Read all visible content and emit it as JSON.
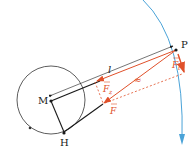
{
  "diagram": {
    "points": {
      "P": {
        "label": "P",
        "x": 176,
        "y": 50
      },
      "M": {
        "label": "M",
        "x": 51,
        "y": 100
      },
      "H": {
        "label": "H",
        "x": 64,
        "y": 133
      }
    },
    "labels": {
      "length": "l",
      "force_z": "F",
      "force_z_sub": "z",
      "force": "F",
      "force_t": "F",
      "force_t_sub": "t",
      "approx": "≈"
    },
    "colors": {
      "line": "#1a1a1a",
      "force": "#e0502a",
      "orbit": "#4aa3d8",
      "circle": "#333333"
    },
    "circle": {
      "cx": 51,
      "cy": 100,
      "r": 34
    }
  }
}
